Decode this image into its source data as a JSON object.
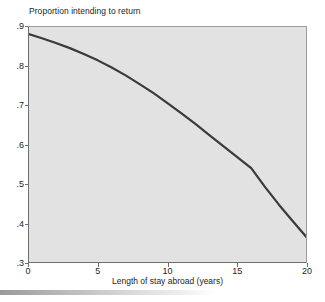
{
  "chart_data": {
    "type": "line",
    "title": "Proportion intending to return",
    "subtitle": "",
    "xlabel": "Length of stay abroad (years)",
    "ylabel": "Proportion intending to return",
    "xlim": [
      0,
      20
    ],
    "ylim": [
      0.3,
      0.9
    ],
    "xticks": [
      0,
      5,
      10,
      15,
      20
    ],
    "xtick_labels": [
      "0",
      "5",
      "10",
      "15",
      "20"
    ],
    "yticks": [
      0.3,
      0.4,
      0.5,
      0.6,
      0.7,
      0.8,
      0.9
    ],
    "ytick_labels": [
      ".3",
      ".4",
      ".5",
      ".6",
      ".7",
      ".8",
      ".9"
    ],
    "grid": false,
    "legend": false,
    "legend_position": "none",
    "annotations": [],
    "series": [
      {
        "name": "Proportion intending to return",
        "color": "#3a3a3a",
        "line_width": 2.2,
        "x": [
          0,
          1,
          2,
          3,
          4,
          5,
          6,
          7,
          8,
          9,
          10,
          11,
          12,
          13,
          14,
          15,
          16,
          17,
          18,
          19,
          20
        ],
        "values": [
          0.88,
          0.869,
          0.857,
          0.844,
          0.829,
          0.813,
          0.795,
          0.775,
          0.753,
          0.73,
          0.705,
          0.679,
          0.652,
          0.624,
          0.596,
          0.568,
          0.54,
          0.492,
          0.447,
          0.405,
          0.364
        ]
      }
    ]
  },
  "axis_titles": {
    "y_top_label": "Proportion intending to return",
    "x_bottom_label": "Length of stay abroad (years)"
  },
  "style": {
    "plot_background": "#e2e2e2",
    "page_background": "#ffffff",
    "axis_color": "#6d6e71",
    "text_color": "#231f20",
    "line_color": "#3a3a3a"
  }
}
